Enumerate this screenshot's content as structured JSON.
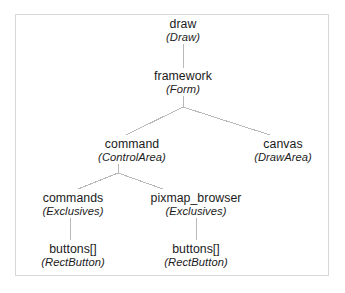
{
  "figure": {
    "border_color": "#d8d8d8",
    "edge_color": "#b9b9b9",
    "text_color": "#1b1b1b",
    "background": "#ffffff"
  },
  "nodes": [
    {
      "id": "draw",
      "object": "draw",
      "class": "(Draw)",
      "x": 183,
      "y": 18
    },
    {
      "id": "framework",
      "object": "framework",
      "class": "(Form)",
      "x": 183,
      "y": 70
    },
    {
      "id": "command",
      "object": "command",
      "class": "(ControlArea)",
      "x": 132,
      "y": 138
    },
    {
      "id": "canvas",
      "object": "canvas",
      "class": "(DrawArea)",
      "x": 283,
      "y": 138
    },
    {
      "id": "commands",
      "object": "commands",
      "class": "(Exclusives)",
      "x": 73,
      "y": 192
    },
    {
      "id": "pixmap_browser",
      "object": "pixmap_browser",
      "class": "(Exclusives)",
      "x": 196,
      "y": 192
    },
    {
      "id": "buttons_left",
      "object": "buttons[]",
      "class": "(RectButton)",
      "x": 73,
      "y": 243
    },
    {
      "id": "buttons_right",
      "object": "buttons[]",
      "class": "(RectButton)",
      "x": 196,
      "y": 243
    }
  ],
  "edges": [
    {
      "id": "draw-framework",
      "from": "draw",
      "to": "framework",
      "x1": 183,
      "y1": 44,
      "x2": 183,
      "y2": 68
    },
    {
      "id": "framework-apex",
      "from": "framework",
      "to": "split",
      "x1": 183,
      "y1": 96,
      "x2": 183,
      "y2": 107
    },
    {
      "id": "framework-command",
      "from": "framework",
      "to": "command",
      "x1": 183,
      "y1": 107,
      "x2": 126,
      "y2": 135
    },
    {
      "id": "framework-canvas",
      "from": "framework",
      "to": "canvas",
      "x1": 183,
      "y1": 107,
      "x2": 270,
      "y2": 135
    },
    {
      "id": "command-apex",
      "from": "command",
      "to": "split",
      "x1": 118,
      "y1": 164,
      "x2": 118,
      "y2": 173
    },
    {
      "id": "command-commands",
      "from": "command",
      "to": "commands",
      "x1": 118,
      "y1": 173,
      "x2": 78,
      "y2": 189
    },
    {
      "id": "command-pixmap_browser",
      "from": "command",
      "to": "pixmap_browser",
      "x1": 118,
      "y1": 173,
      "x2": 163,
      "y2": 189
    },
    {
      "id": "commands-buttons",
      "from": "commands",
      "to": "buttons_left",
      "x1": 70,
      "y1": 218,
      "x2": 70,
      "y2": 240
    },
    {
      "id": "pixmap_browser-buttons",
      "from": "pixmap_browser",
      "to": "buttons_right",
      "x1": 196,
      "y1": 218,
      "x2": 196,
      "y2": 240
    }
  ]
}
